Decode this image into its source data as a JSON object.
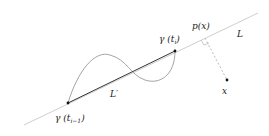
{
  "diagram": {
    "labels": {
      "line_L": "L",
      "segment_L_prime": "L′",
      "point_gamma_ti": "γ (t",
      "point_gamma_ti_sub": "i",
      "point_gamma_ti_close": ")",
      "point_gamma_ti1": "γ (t",
      "point_gamma_ti1_sub": "i−1",
      "point_gamma_ti1_close": ")",
      "projection": "p(x)",
      "point_x": "x"
    },
    "colors": {
      "line_L": "#c8c8c8",
      "segment": "#333333",
      "curve": "#999999",
      "perpendicular": "#bbbbbb",
      "points": "#111111"
    }
  }
}
